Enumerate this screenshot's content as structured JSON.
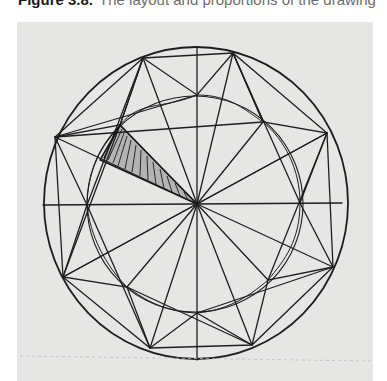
{
  "caption": {
    "label": "Figure 3.8.",
    "text": "The layout and proportions of the drawing",
    "tail": "g"
  },
  "figure": {
    "background": "#e6e6e4",
    "stroke": "#1e1e1e"
  }
}
